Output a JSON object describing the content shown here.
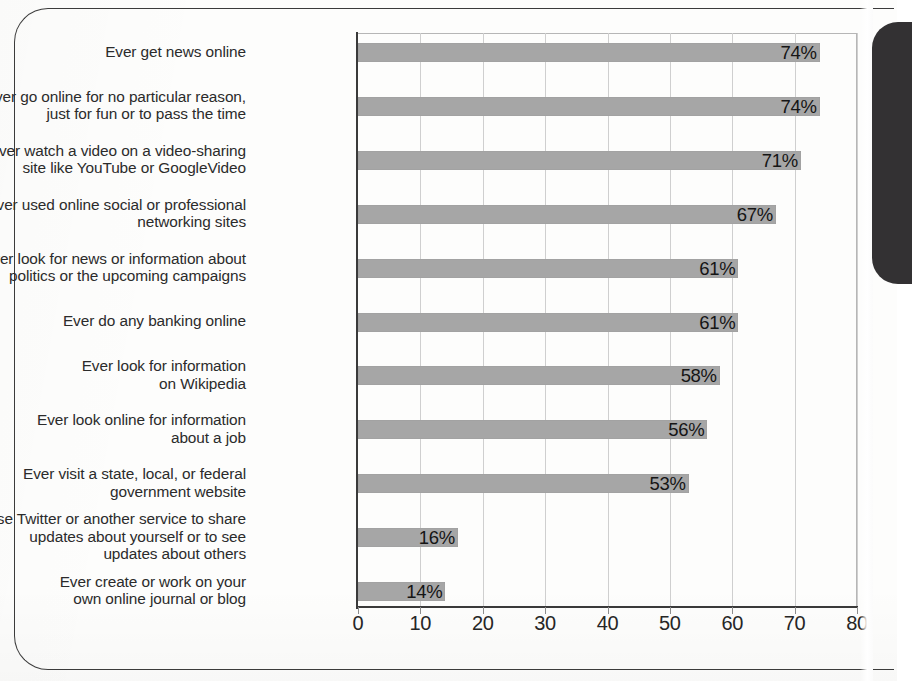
{
  "chart_data": {
    "type": "bar",
    "orientation": "horizontal",
    "title": "",
    "xlabel": "",
    "ylabel": "",
    "xlim": [
      0,
      80
    ],
    "xticks": [
      0,
      10,
      20,
      30,
      40,
      50,
      60,
      70,
      80
    ],
    "tick_labels": [
      "0",
      "10",
      "20",
      "30",
      "40",
      "50",
      "60",
      "70",
      "80"
    ],
    "grid": true,
    "grid_axis": "x",
    "legend": false,
    "value_label_suffix": "%",
    "value_label_position": "inside-end",
    "bar_color": "#a6a6a6",
    "axis_color": "#3a3a3a",
    "gridline_color": "#cfcfcf",
    "categories": [
      "Ever get news online",
      "Ever go online for no particular reason, just for fun or to pass the time",
      "Ever watch a video on a video-sharing site like YouTube or GoogleVideo",
      "Ever used online social or professional networking sites",
      "Ever look for news or information about politics or the upcoming campaigns",
      "Ever do any banking online",
      "Ever look for information on Wikipedia",
      "Ever look online for information about a job",
      "Ever visit a state, local, or federal government website",
      "Use Twitter or another service to share updates about yourself or to see updates about others",
      "Ever create or work on your own online journal or blog"
    ],
    "values": [
      74,
      74,
      71,
      67,
      61,
      61,
      58,
      56,
      53,
      16,
      14
    ],
    "value_labels": [
      "74%",
      "74%",
      "71%",
      "67%",
      "61%",
      "61%",
      "58%",
      "56%",
      "53%",
      "16%",
      "14%"
    ]
  },
  "rows": [
    {
      "label_lines": [
        "Ever get news online"
      ],
      "value": 74,
      "value_label": "74%"
    },
    {
      "label_lines": [
        "Ever go online for no particular reason,",
        "just for fun or to pass the time"
      ],
      "value": 74,
      "value_label": "74%"
    },
    {
      "label_lines": [
        "Ever watch a video on a video-sharing",
        "site like YouTube or GoogleVideo"
      ],
      "value": 71,
      "value_label": "71%"
    },
    {
      "label_lines": [
        "Ever used online social or professional",
        "networking sites"
      ],
      "value": 67,
      "value_label": "67%"
    },
    {
      "label_lines": [
        "Ever look for news or information about",
        "politics or the upcoming campaigns"
      ],
      "value": 61,
      "value_label": "61%"
    },
    {
      "label_lines": [
        "Ever do any banking online"
      ],
      "value": 61,
      "value_label": "61%"
    },
    {
      "label_lines": [
        "Ever look for information",
        "on Wikipedia"
      ],
      "value": 58,
      "value_label": "58%"
    },
    {
      "label_lines": [
        "Ever look online for information",
        "about a job"
      ],
      "value": 56,
      "value_label": "56%"
    },
    {
      "label_lines": [
        "Ever visit a state, local, or federal",
        "government website"
      ],
      "value": 53,
      "value_label": "53%"
    },
    {
      "label_lines": [
        "Use Twitter or another service to share",
        "updates about yourself or to see",
        "updates about others"
      ],
      "value": 16,
      "value_label": "16%"
    },
    {
      "label_lines": [
        "Ever create or work on your",
        "own online journal or blog"
      ],
      "value": 14,
      "value_label": "14%"
    }
  ],
  "axis": {
    "ticks": [
      "0",
      "10",
      "20",
      "30",
      "40",
      "50",
      "60",
      "70",
      "80"
    ]
  }
}
